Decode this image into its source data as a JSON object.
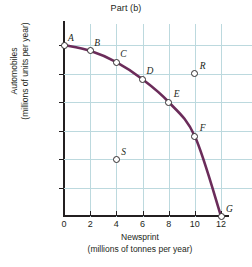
{
  "chart_data": {
    "type": "line",
    "title": "Part (b)",
    "xlabel_line1": "Newsprint",
    "xlabel_line2": "(millions of tonnes per year)",
    "ylabel_line1": "Automobiles",
    "ylabel_line2": "(millions of units per year)",
    "xlim": [
      0,
      12
    ],
    "ylim": [
      0,
      3.0
    ],
    "xticks": [
      "0",
      "2",
      "4",
      "6",
      "8",
      "10",
      "12"
    ],
    "xtick_values": [
      0,
      2,
      4,
      6,
      8,
      10,
      12
    ],
    "yticks": [
      "0.5",
      "1.0",
      "1.5",
      "2.0",
      "2.5",
      "3.0"
    ],
    "ytick_values": [
      0.5,
      1.0,
      1.5,
      2.0,
      2.5,
      3.0
    ],
    "grid": true,
    "legend": "none",
    "curve_color": "#6b2c5a",
    "grid_color": "#bcd9de",
    "axis_color": "#231f20",
    "series": [
      {
        "name": "Production possibilities frontier",
        "label_placement": "point-annotations",
        "points": [
          {
            "label": "A",
            "x": 0,
            "y": 3.0,
            "on_curve": true,
            "label_dx": 4,
            "label_dy": -12
          },
          {
            "label": "B",
            "x": 2,
            "y": 2.9,
            "on_curve": true,
            "label_dx": 4,
            "label_dy": -13
          },
          {
            "label": "C",
            "x": 4,
            "y": 2.7,
            "on_curve": true,
            "label_dx": 4,
            "label_dy": -13
          },
          {
            "label": "D",
            "x": 6,
            "y": 2.4,
            "on_curve": true,
            "label_dx": 4,
            "label_dy": -13
          },
          {
            "label": "E",
            "x": 8,
            "y": 2.0,
            "on_curve": true,
            "label_dx": 5,
            "label_dy": -13
          },
          {
            "label": "F",
            "x": 10,
            "y": 1.4,
            "on_curve": true,
            "label_dx": 5,
            "label_dy": -13
          },
          {
            "label": "G",
            "x": 12,
            "y": 0.0,
            "on_curve": true,
            "label_dx": 5,
            "label_dy": -12
          }
        ]
      }
    ],
    "extra_points": [
      {
        "label": "R",
        "x": 10,
        "y": 2.5,
        "on_curve": false,
        "region": "unattainable",
        "label_dx": 5,
        "label_dy": -13
      },
      {
        "label": "S",
        "x": 4,
        "y": 1.0,
        "on_curve": false,
        "region": "inefficient",
        "label_dx": 5,
        "label_dy": -12
      }
    ]
  }
}
